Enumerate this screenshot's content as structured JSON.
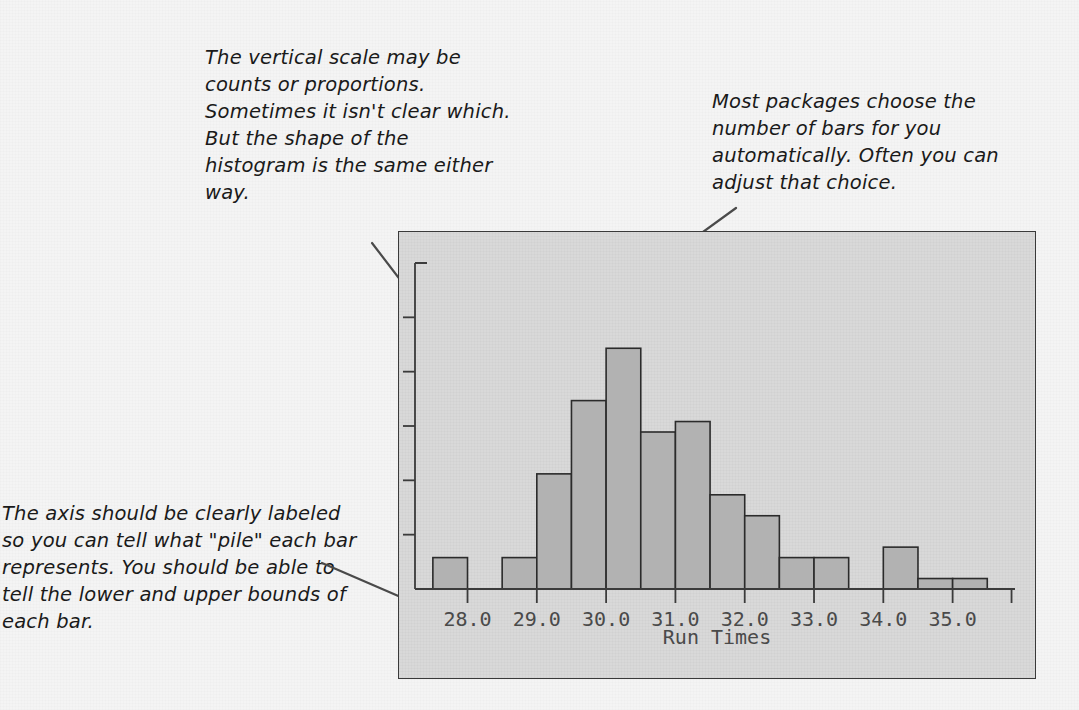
{
  "page": {
    "background_color": "#f4f4f4",
    "ink_color": "#1a1a1a"
  },
  "annotations": [
    {
      "id": "vertical-scale",
      "text": "The vertical scale may be counts or proportions. Sometimes it isn't clear which. But the shape of the histogram is the same either way."
    },
    {
      "id": "bar-count",
      "text": "Most packages choose the number of bars for you automatically. Often you can adjust that choice."
    },
    {
      "id": "axis-labeling",
      "text": "The axis should be clearly labeled so you can tell what \"pile\" each bar represents. You should be able to tell the lower and upper bounds of each bar."
    }
  ],
  "chart_data": {
    "type": "bar",
    "title": "",
    "subtitle": "",
    "xlabel": "Run Times",
    "ylabel": "",
    "grid": false,
    "legend": false,
    "x_tick_labels": [
      "28.0",
      "29.0",
      "30.0",
      "31.0",
      "32.0",
      "33.0",
      "34.0",
      "35.0"
    ],
    "x_tick_values": [
      28.0,
      29.0,
      30.0,
      31.0,
      32.0,
      33.0,
      34.0,
      35.0
    ],
    "xlim": [
      27.3,
      35.9
    ],
    "y_axis_labeled": false,
    "y_tick_count": 6,
    "ylim": [
      0,
      30
    ],
    "bin_width": 0.5,
    "bin_edges": [
      27.5,
      28.0,
      28.5,
      29.0,
      29.5,
      30.0,
      30.5,
      31.0,
      31.5,
      32.0,
      32.5,
      33.0,
      33.5,
      34.0,
      34.5,
      35.0,
      35.5
    ],
    "categories": [
      "27.5-28.0",
      "28.0-28.5",
      "28.5-29.0",
      "29.0-29.5",
      "29.5-30.0",
      "30.0-30.5",
      "30.5-31.0",
      "31.0-31.5",
      "31.5-32.0",
      "32.0-32.5",
      "32.5-33.0",
      "33.0-33.5",
      "33.5-34.0",
      "34.0-34.5",
      "34.5-35.0",
      "35.0-35.5"
    ],
    "values": [
      3,
      0,
      3,
      11,
      18,
      23,
      15,
      16,
      9,
      7,
      3,
      3,
      0,
      4,
      1,
      1
    ],
    "bar_fill_color": "#b2b2b2",
    "bar_edge_color": "#2b2b2b",
    "panel_background_color": "#d9d9d9",
    "panel_border_color": "#3a3a3a"
  }
}
